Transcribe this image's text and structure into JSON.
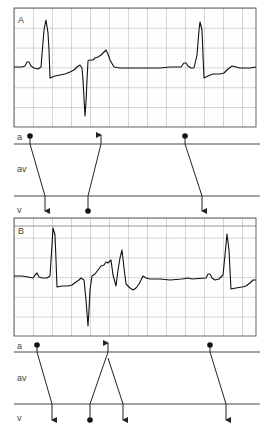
{
  "panels": [
    {
      "id": "A",
      "label": "A",
      "strip": {
        "x": 14,
        "y": 8,
        "w": 242,
        "h": 119
      },
      "ladder": {
        "top": 144,
        "mid": 196,
        "bottom": 226
      },
      "row_labels": {
        "a": "a",
        "av": "av",
        "v": "v"
      }
    },
    {
      "id": "B",
      "label": "B",
      "strip": {
        "x": 14,
        "y": 218,
        "w": 242,
        "h": 118
      },
      "ladder": {
        "top": 352,
        "mid": 404,
        "bottom": 433
      },
      "row_labels": {
        "a": "a",
        "av": "av",
        "v": "v"
      }
    }
  ],
  "colors": {
    "trace": "#111111",
    "grid_major": "#888888",
    "grid_minor": "#c8c8c8",
    "ladder": "#333333"
  }
}
